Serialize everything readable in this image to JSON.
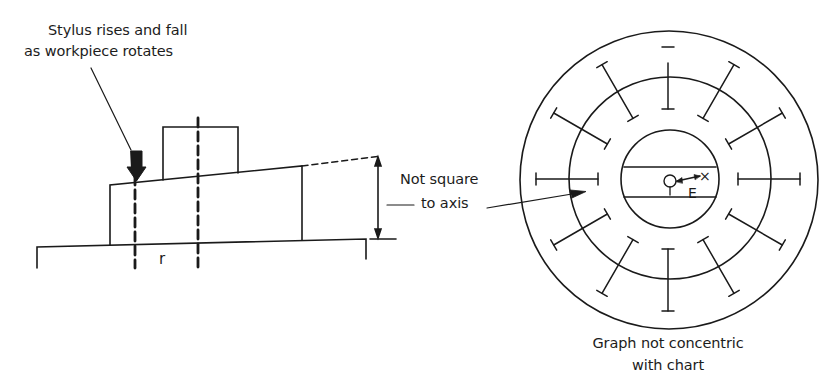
{
  "figure": {
    "left_diagram": {
      "name": "workpiece-on-turntable",
      "labels": {
        "stylus_note_line1": "Stylus rises and fall",
        "stylus_note_line2": "as workpiece rotates",
        "radius_label": "r",
        "not_square_line1": "Not square",
        "not_square_line2": "to axis"
      }
    },
    "right_diagram": {
      "name": "polar-chart",
      "labels": {
        "center_origin": "O",
        "eccentricity": "E",
        "offset_point": "×",
        "caption_line1": "Graph not concentric",
        "caption_line2": "with chart"
      },
      "rings": {
        "outer_radius": 149,
        "middle_radius": 101,
        "inner_radius": 49
      },
      "tick_angles_deg": [
        0,
        30,
        60,
        90,
        120,
        150,
        180,
        210,
        240,
        270,
        300,
        330
      ],
      "tick_count": 12
    },
    "stroke_color": "#1a1a1a",
    "background": "#ffffff"
  }
}
